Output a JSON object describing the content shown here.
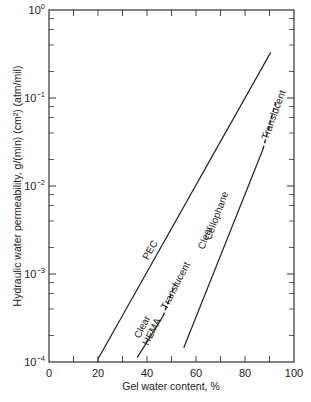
{
  "chart_data": {
    "type": "line",
    "title": "",
    "xlabel": "Gel water content, %",
    "ylabel": "Hydraulic water permeability, g/(min) (cm²) (atm/mil)",
    "xlim": [
      0,
      100
    ],
    "ylim": [
      0.0001,
      1
    ],
    "yscale": "log",
    "grid": false,
    "legend": "none (inline labels)",
    "x_ticks": [
      0,
      20,
      40,
      60,
      80,
      100
    ],
    "x_tick_labels": [
      "0",
      "20",
      "40",
      "60",
      "80",
      "100"
    ],
    "x_minor_ticks": [
      10,
      30,
      50,
      70,
      90
    ],
    "y_ticks": [
      1,
      0.1,
      0.01,
      0.001,
      0.0001
    ],
    "y_tick_labels": [
      {
        "base": "10",
        "exp": "0"
      },
      {
        "base": "10",
        "exp": "−1"
      },
      {
        "base": "10",
        "exp": "−2"
      },
      {
        "base": "10",
        "exp": "−3"
      },
      {
        "base": "10",
        "exp": "−4"
      }
    ],
    "series": [
      {
        "name": "PEC",
        "segments": [
          {
            "style": "solid",
            "x": [
              20,
              90.5
            ],
            "y": [
              0.000108,
              0.33
            ]
          }
        ],
        "labels": [
          {
            "text": "PEC",
            "at_x": 39,
            "at_y": 0.0015,
            "side": "above"
          }
        ]
      },
      {
        "name": "HEMA",
        "segments": [
          {
            "style": "solid",
            "x": [
              36,
              46.5
            ],
            "y": [
              0.000112,
              0.00033
            ]
          },
          {
            "style": "dashed",
            "x": [
              46.5,
              51.5
            ],
            "y": [
              0.00033,
              0.00078
            ]
          }
        ],
        "labels": [
          {
            "text": "HEMA",
            "at_x": 39,
            "at_y": 0.00016,
            "side": "above"
          },
          {
            "text": "Clear",
            "at_x": 41,
            "at_y": 0.00016,
            "side": "below"
          },
          {
            "text": "Translucent",
            "at_x": 52,
            "at_y": 0.00034,
            "side": "below"
          }
        ]
      },
      {
        "name": "Cellophane",
        "segments": [
          {
            "style": "solid",
            "x": [
              55,
              87.3
            ],
            "y": [
              0.000145,
              0.026
            ]
          },
          {
            "style": "dashed",
            "x": [
              87.3,
              92.5
            ],
            "y": [
              0.026,
              0.09
            ]
          }
        ],
        "labels": [
          {
            "text": "Cellophane",
            "at_x": 64.5,
            "at_y": 0.0025,
            "side": "above"
          },
          {
            "text": "Clear",
            "at_x": 67.5,
            "at_y": 0.0017,
            "side": "below"
          },
          {
            "text": "Translucent",
            "at_x": 93.5,
            "at_y": 0.03,
            "side": "below"
          }
        ]
      }
    ]
  }
}
